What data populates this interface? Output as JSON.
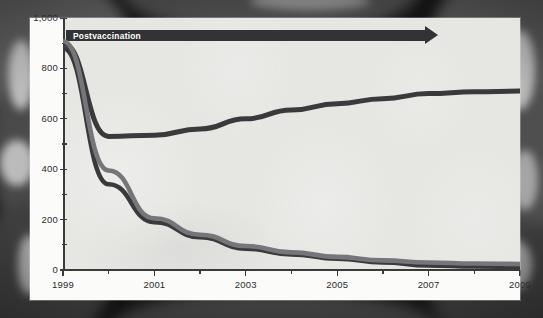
{
  "figure": {
    "background_description": "grayscale-ct-scan",
    "panel_bg": "#f2f2f0",
    "plot_bg": "#e2e2e0"
  },
  "banner": {
    "label": "Postvaccination",
    "color": "#333335",
    "text_color": "#ffffff",
    "start_year": 1999,
    "end_year": 2007.1
  },
  "chart_data": {
    "type": "line",
    "title": "",
    "xlabel": "",
    "ylabel": "",
    "xlim": [
      1999,
      2009
    ],
    "ylim": [
      0,
      1000
    ],
    "grid": false,
    "legend": "none",
    "x": [
      1999,
      2000,
      2001,
      2002,
      2003,
      2004,
      2005,
      2006,
      2007,
      2008,
      2009
    ],
    "xtick_labels": [
      "1999",
      "2001",
      "2003",
      "2005",
      "2007",
      "2009"
    ],
    "xtick_values": [
      1999,
      2001,
      2003,
      2005,
      2007,
      2009
    ],
    "xtick_minor": [
      2000,
      2002,
      2004,
      2006,
      2008
    ],
    "ytick_labels": [
      "0",
      "200",
      "400",
      "600",
      "800",
      "1,000"
    ],
    "ytick_values": [
      0,
      200,
      400,
      600,
      800,
      1000
    ],
    "ytick_minor": [
      100,
      300,
      500,
      700,
      900
    ],
    "series": [
      {
        "name": "series-upper",
        "color": "#3a3a3c",
        "width": 5.0,
        "values": [
          900,
          530,
          535,
          560,
          600,
          635,
          660,
          680,
          700,
          707,
          710
        ]
      },
      {
        "name": "series-lower-dark",
        "color": "#3a3a3c",
        "width": 4.6,
        "values": [
          880,
          340,
          190,
          130,
          85,
          62,
          45,
          30,
          18,
          14,
          12
        ]
      },
      {
        "name": "series-lower-gray",
        "color": "#76767a",
        "width": 4.6,
        "values": [
          908,
          395,
          205,
          140,
          95,
          70,
          52,
          38,
          30,
          26,
          24
        ]
      }
    ]
  }
}
